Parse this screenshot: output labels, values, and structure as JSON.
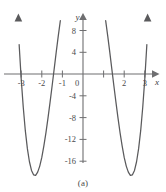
{
  "figure": {
    "caption": "(a)",
    "background_color": "#ffffff",
    "curve_color": "#5a5a5c",
    "axis_color": "#6e6e70",
    "label_color": "#4a4a4c"
  },
  "axes": {
    "x_axis_name": "x",
    "y_axis_name": "y",
    "x_tick_labels": [
      "-3",
      "-2",
      "-1",
      "2",
      "3"
    ],
    "y_tick_labels": [
      "8",
      "4",
      "0",
      "-4",
      "-8",
      "-12",
      "-16"
    ],
    "origin_label": "0"
  },
  "chart_data": {
    "type": "line",
    "title": "",
    "xlabel": "x",
    "ylabel": "y",
    "xlim": [
      -3.45,
      3.45
    ],
    "ylim": [
      -19.0,
      11.0
    ],
    "grid": false,
    "legend": null,
    "x_ticks": [
      -3,
      -2,
      -1,
      0,
      1,
      2,
      3
    ],
    "x_tick_labels": [
      "-3",
      "-2",
      "-1",
      "0",
      "",
      "2",
      "3"
    ],
    "y_ticks": [
      8,
      4,
      0,
      -4,
      -8,
      -12,
      -16
    ],
    "y_tick_labels": [
      "8",
      "4",
      "0",
      "-4",
      "-8",
      "-12",
      "-16"
    ],
    "annotations": [
      {
        "label": "local maximum",
        "x": 0,
        "y": 9
      },
      {
        "label": "local minimum",
        "x": -2.2,
        "y": -16
      },
      {
        "label": "local minimum",
        "x": 2.2,
        "y": -16
      },
      {
        "label": "x-intercept",
        "x": -2.9,
        "y": 0
      },
      {
        "label": "x-intercept",
        "x": -1.0,
        "y": 0
      },
      {
        "label": "x-intercept",
        "x": 1.0,
        "y": 0
      },
      {
        "label": "x-intercept",
        "x": 2.9,
        "y": 0
      }
    ],
    "series": [
      {
        "name": "y = f(x)",
        "x": [
          -3.3,
          -3.2,
          -3.1,
          -3.0,
          -2.9,
          -2.8,
          -2.7,
          -2.6,
          -2.5,
          -2.4,
          -2.3,
          -2.2,
          -2.1,
          -2.0,
          -1.9,
          -1.8,
          -1.7,
          -1.6,
          -1.5,
          -1.4,
          -1.3,
          -1.2,
          -1.1,
          -1.0,
          -0.9,
          -0.8,
          -0.7,
          -0.6,
          -0.5,
          -0.4,
          -0.3,
          -0.2,
          -0.1,
          0.0,
          0.1,
          0.2,
          0.3,
          0.4,
          0.5,
          0.6,
          0.7,
          0.8,
          0.9,
          1.0,
          1.1,
          1.2,
          1.3,
          1.4,
          1.5,
          1.6,
          1.7,
          1.8,
          1.9,
          2.0,
          2.1,
          2.2,
          2.3,
          2.4,
          2.5,
          2.6,
          2.7,
          2.8,
          2.9,
          3.0,
          3.1,
          3.2,
          3.3
        ],
        "y": [
          21.1,
          12.7,
          5.4,
          -0.9,
          -6.1,
          -10.4,
          -13.7,
          -16.1,
          -17.7,
          -18.5,
          -18.6,
          -18.0,
          -16.9,
          -15.3,
          -13.2,
          -10.8,
          -8.1,
          -5.2,
          -2.2,
          0.9,
          4.0,
          7.0,
          9.8,
          12.3,
          14.4,
          16.1,
          17.3,
          18.0,
          18.0,
          17.4,
          16.2,
          14.4,
          12.0,
          9.0,
          12.0,
          14.4,
          16.2,
          17.4,
          18.0,
          18.0,
          17.3,
          16.1,
          14.4,
          12.3,
          9.8,
          7.0,
          4.0,
          0.9,
          -2.2,
          -5.2,
          -8.1,
          -10.8,
          -13.2,
          -15.3,
          -16.9,
          -18.0,
          -18.6,
          -18.5,
          -17.7,
          -16.1,
          -13.7,
          -10.4,
          -6.1,
          -0.9,
          5.4,
          12.7,
          21.1
        ],
        "color": "#5a5a5c"
      }
    ]
  }
}
